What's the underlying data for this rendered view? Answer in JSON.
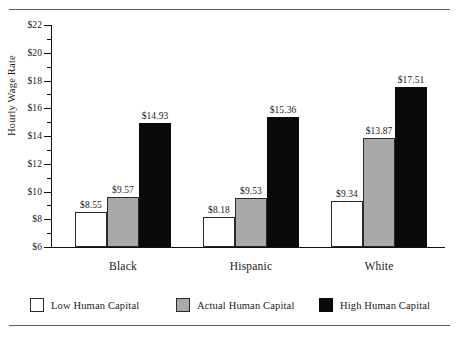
{
  "chart_data": {
    "type": "bar",
    "title": "",
    "xlabel": "",
    "ylabel": "Hourly Wage Rate",
    "ylim": [
      6,
      22
    ],
    "ytick_step": 2,
    "yminor_step": 1,
    "grid": false,
    "legend_position": "bottom",
    "value_prefix": "$",
    "categories": [
      "Black",
      "Hispanic",
      "White"
    ],
    "series": [
      {
        "name": "Low Human Capital",
        "color": "#ffffff",
        "values": [
          8.55,
          9.53,
          9.34
        ],
        "labels": [
          "$8.55",
          "$8.18",
          "$9.34"
        ],
        "values_corrected": [
          8.55,
          8.18,
          9.34
        ]
      },
      {
        "name": "Actual Human Capital",
        "color": "#a9a9a9",
        "values": [
          9.57,
          9.53,
          13.87
        ],
        "labels": [
          "$9.57",
          "$9.53",
          "$13.87"
        ]
      },
      {
        "name": "High Human Capital",
        "color": "#0a0a0a",
        "values": [
          14.93,
          15.36,
          17.51
        ],
        "labels": [
          "$14.93",
          "$15.36",
          "$17.51"
        ]
      }
    ],
    "ytick_labels": [
      "$6",
      "$8",
      "$10",
      "$12",
      "$14",
      "$16",
      "$18",
      "$20",
      "$22"
    ]
  },
  "axis": {
    "y_title": "Hourly Wage Rate",
    "ticks": [
      {
        "value": 22,
        "label": "$22",
        "major": true
      },
      {
        "value": 21,
        "label": "",
        "major": false
      },
      {
        "value": 20,
        "label": "$20",
        "major": true
      },
      {
        "value": 19,
        "label": "",
        "major": false
      },
      {
        "value": 18,
        "label": "$18",
        "major": true
      },
      {
        "value": 17,
        "label": "",
        "major": false
      },
      {
        "value": 16,
        "label": "$16",
        "major": true
      },
      {
        "value": 15,
        "label": "",
        "major": false
      },
      {
        "value": 14,
        "label": "$14",
        "major": true
      },
      {
        "value": 13,
        "label": "",
        "major": false
      },
      {
        "value": 12,
        "label": "$12",
        "major": true
      },
      {
        "value": 11,
        "label": "",
        "major": false
      },
      {
        "value": 10,
        "label": "$10",
        "major": true
      },
      {
        "value": 9,
        "label": "",
        "major": false
      },
      {
        "value": 8,
        "label": "$8",
        "major": true
      },
      {
        "value": 7,
        "label": "",
        "major": false
      },
      {
        "value": 6,
        "label": "$6",
        "major": true
      }
    ]
  },
  "groups": [
    {
      "label": "Black",
      "bars": [
        {
          "series": "Low Human Capital",
          "value": 8.55,
          "label": "$8.55",
          "style": "low"
        },
        {
          "series": "Actual Human Capital",
          "value": 9.57,
          "label": "$9.57",
          "style": "act"
        },
        {
          "series": "High Human Capital",
          "value": 14.93,
          "label": "$14.93",
          "style": "high"
        }
      ]
    },
    {
      "label": "Hispanic",
      "bars": [
        {
          "series": "Low Human Capital",
          "value": 8.18,
          "label": "$8.18",
          "style": "low"
        },
        {
          "series": "Actual Human Capital",
          "value": 9.53,
          "label": "$9.53",
          "style": "act"
        },
        {
          "series": "High Human Capital",
          "value": 15.36,
          "label": "$15.36",
          "style": "high"
        }
      ]
    },
    {
      "label": "White",
      "bars": [
        {
          "series": "Low Human Capital",
          "value": 9.34,
          "label": "$9.34",
          "style": "low"
        },
        {
          "series": "Actual Human Capital",
          "value": 13.87,
          "label": "$13.87",
          "style": "act"
        },
        {
          "series": "High Human Capital",
          "value": 17.51,
          "label": "$17.51",
          "style": "high"
        }
      ]
    }
  ],
  "legend": {
    "items": [
      {
        "label": "Low Human Capital",
        "style": "low",
        "color": "#ffffff"
      },
      {
        "label": "Actual Human Capital",
        "style": "act",
        "color": "#a9a9a9"
      },
      {
        "label": "High Human Capital",
        "style": "high",
        "color": "#0a0a0a"
      }
    ]
  }
}
